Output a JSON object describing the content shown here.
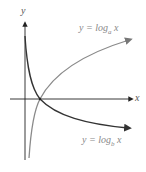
{
  "axes": {
    "x_label": "x",
    "y_label": "y"
  },
  "curves": [
    {
      "name": "log-a-curve",
      "label_prefix": "y = log",
      "base": "a",
      "var": "x",
      "color": "#8a8a8a"
    },
    {
      "name": "log-b-curve",
      "label_prefix": "y = log",
      "base": "b",
      "var": "x",
      "color": "#333333"
    }
  ],
  "colors": {
    "axis": "#222222",
    "label": "#888888"
  }
}
